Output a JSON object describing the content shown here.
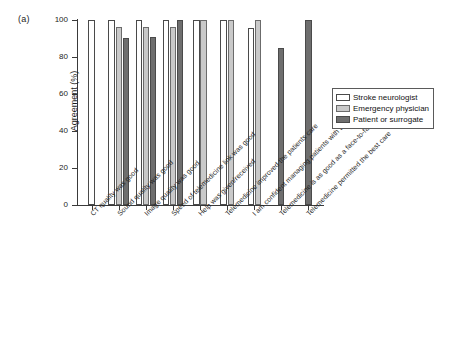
{
  "panel": {
    "label": "(a)"
  },
  "chart_data": {
    "type": "bar",
    "title": "",
    "xlabel": "",
    "ylabel": "Agreement (%)",
    "ylim": [
      0,
      100
    ],
    "yticks": [
      0,
      20,
      40,
      60,
      80,
      100
    ],
    "ytick_labels": [
      "0",
      "20",
      "40",
      "60",
      "80",
      "100"
    ],
    "grid": false,
    "legend_position": "right",
    "categories": [
      "CT quality was good",
      "Sound quality was good",
      "Image quality was good",
      "Speed of telemedicine link was good",
      "Help was given/received",
      "Telemedicine improved the patients care",
      "I am confident managing patients with telemedicine",
      "Telemedicine is as good as a face-to-face encounter",
      "Telemedicine permitted the best care"
    ],
    "series": [
      {
        "name": "Stroke neurologist",
        "color": "#ffffff",
        "values": [
          100,
          100,
          100,
          100,
          100,
          100,
          95.5,
          null,
          null
        ]
      },
      {
        "name": "Emergency physician",
        "color": "#c9c9c9",
        "values": [
          null,
          96.2,
          96.3,
          96,
          100,
          100,
          100,
          null,
          null
        ]
      },
      {
        "name": "Patient or surrogate",
        "color": "#6e6e6e",
        "values": [
          null,
          90.5,
          90.6,
          100,
          null,
          null,
          null,
          85,
          100
        ]
      }
    ]
  },
  "legend": {
    "items": [
      {
        "label": "Stroke neurologist"
      },
      {
        "label": "Emergency physician"
      },
      {
        "label": "Patient or surrogate"
      }
    ]
  }
}
